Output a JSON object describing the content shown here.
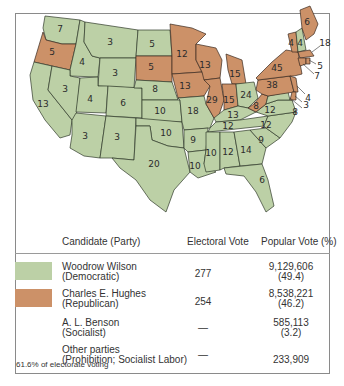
{
  "map": {
    "colors": {
      "democratic": "#bcd0a6",
      "republican": "#cc9168"
    },
    "states": [
      {
        "abbr": "WA",
        "ev": "7",
        "party": "D"
      },
      {
        "abbr": "OR",
        "ev": "5",
        "party": "R"
      },
      {
        "abbr": "CA",
        "ev": "13",
        "party": "D"
      },
      {
        "abbr": "ID",
        "ev": "4",
        "party": "D"
      },
      {
        "abbr": "NV",
        "ev": "3",
        "party": "D"
      },
      {
        "abbr": "MT",
        "ev": "3",
        "party": "D"
      },
      {
        "abbr": "WY",
        "ev": "3",
        "party": "D"
      },
      {
        "abbr": "UT",
        "ev": "4",
        "party": "D"
      },
      {
        "abbr": "CO",
        "ev": "6",
        "party": "D"
      },
      {
        "abbr": "AZ",
        "ev": "3",
        "party": "D"
      },
      {
        "abbr": "NM",
        "ev": "3",
        "party": "D"
      },
      {
        "abbr": "ND",
        "ev": "5",
        "party": "D"
      },
      {
        "abbr": "SD",
        "ev": "5",
        "party": "R"
      },
      {
        "abbr": "NE",
        "ev": "8",
        "party": "D"
      },
      {
        "abbr": "KS",
        "ev": "10",
        "party": "D"
      },
      {
        "abbr": "OK",
        "ev": "10",
        "party": "D"
      },
      {
        "abbr": "TX",
        "ev": "20",
        "party": "D"
      },
      {
        "abbr": "MN",
        "ev": "12",
        "party": "R"
      },
      {
        "abbr": "IA",
        "ev": "13",
        "party": "R"
      },
      {
        "abbr": "MO",
        "ev": "18",
        "party": "D"
      },
      {
        "abbr": "AR",
        "ev": "9",
        "party": "D"
      },
      {
        "abbr": "LA",
        "ev": "10",
        "party": "D"
      },
      {
        "abbr": "WI",
        "ev": "13",
        "party": "R"
      },
      {
        "abbr": "IL",
        "ev": "29",
        "party": "R"
      },
      {
        "abbr": "MI",
        "ev": "15",
        "party": "R"
      },
      {
        "abbr": "IN",
        "ev": "15",
        "party": "R"
      },
      {
        "abbr": "OH",
        "ev": "24",
        "party": "D"
      },
      {
        "abbr": "KY",
        "ev": "13",
        "party": "D"
      },
      {
        "abbr": "TN",
        "ev": "12",
        "party": "D"
      },
      {
        "abbr": "MS",
        "ev": "10",
        "party": "D"
      },
      {
        "abbr": "AL",
        "ev": "12",
        "party": "D"
      },
      {
        "abbr": "GA",
        "ev": "14",
        "party": "D"
      },
      {
        "abbr": "FL",
        "ev": "6",
        "party": "D"
      },
      {
        "abbr": "SC",
        "ev": "9",
        "party": "D"
      },
      {
        "abbr": "NC",
        "ev": "12",
        "party": "D"
      },
      {
        "abbr": "VA",
        "ev": "12",
        "party": "D"
      },
      {
        "abbr": "WV",
        "ev": "8",
        "party": "R"
      },
      {
        "abbr": "PA",
        "ev": "38",
        "party": "R"
      },
      {
        "abbr": "NY",
        "ev": "45",
        "party": "R"
      },
      {
        "abbr": "VT",
        "ev": "4",
        "party": "R"
      },
      {
        "abbr": "NH",
        "ev": "4",
        "party": "D"
      },
      {
        "abbr": "ME",
        "ev": "6",
        "party": "R"
      },
      {
        "abbr": "MA",
        "ev": "18",
        "party": "R"
      },
      {
        "abbr": "RI",
        "ev": "5",
        "party": "R"
      },
      {
        "abbr": "CT",
        "ev": "7",
        "party": "R"
      },
      {
        "abbr": "NJ",
        "ev": "14",
        "party": "R"
      },
      {
        "abbr": "DE",
        "ev": "3",
        "party": "R"
      },
      {
        "abbr": "MD",
        "ev": "8",
        "party": "D"
      }
    ]
  },
  "table": {
    "headers": {
      "candidate": "Candidate (Party)",
      "electoral": "Electoral Vote",
      "popular": "Popular Vote (%)"
    },
    "rows": [
      {
        "name": "Woodrow Wilson",
        "party": "(Democratic)",
        "ev": "277",
        "pv": "9,129,606",
        "pct": "(49.4)",
        "swatch": "#bcd0a6"
      },
      {
        "name": "Charles E. Hughes",
        "party": "(Republican)",
        "ev": "254",
        "pv": "8,538,221",
        "pct": "(46.2)",
        "swatch": "#cc9168"
      },
      {
        "name": "A. L. Benson",
        "party": "(Socialist)",
        "ev": "—",
        "pv": "585,113",
        "pct": "(3.2)",
        "swatch": null
      },
      {
        "name": "Other parties",
        "party": "(Prohibition; Socialist Labor)",
        "ev": "—",
        "pv": "233,909",
        "pct": "",
        "swatch": null
      }
    ]
  },
  "footnote": "61.6% of electorate voting"
}
